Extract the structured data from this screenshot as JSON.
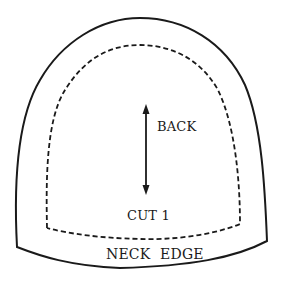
{
  "pattern": {
    "grainline_label": "BACK",
    "cut_label": "CUT 1",
    "edge_label": "NECK EDGE",
    "outline_color": "#1a1a1a",
    "background_color": "#ffffff"
  }
}
